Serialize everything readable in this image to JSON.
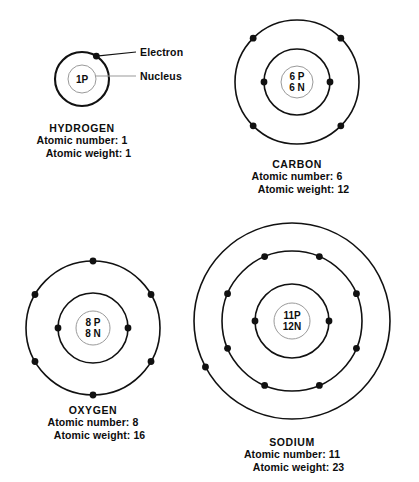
{
  "figure": {
    "background_color": "#ffffff",
    "orbit_color": "#111111",
    "nucleus_stroke_color": "#9a9a9a",
    "electron_color": "#111111",
    "text_color": "#0d0d0d"
  },
  "callouts": {
    "electron": "Electron",
    "nucleus": "Nucleus"
  },
  "labels": {
    "atomic_number_prefix": "Atomic number:",
    "atomic_weight_prefix": "Atomic weight:"
  },
  "atoms": [
    {
      "id": "hydrogen",
      "name": "HYDROGEN",
      "nucleus_text": [
        "1P"
      ],
      "protons": 1,
      "neutrons": 0,
      "atomic_number": 1,
      "atomic_weight": 1,
      "atomic_number_text": "Atomic number: 1",
      "atomic_weight_text": "Atomic weight: 1",
      "shells": [
        {
          "radius": 27,
          "electron_count": 1,
          "electron_angles": [
            58
          ]
        }
      ],
      "nucleus_radius": 14,
      "center": {
        "x": 82,
        "y": 79
      }
    },
    {
      "id": "carbon",
      "name": "CARBON",
      "nucleus_text": [
        "6 P",
        "6 N"
      ],
      "protons": 6,
      "neutrons": 6,
      "atomic_number": 6,
      "atomic_weight": 12,
      "atomic_number_text": "Atomic number: 6",
      "atomic_weight_text": "Atomic weight: 12",
      "shells": [
        {
          "radius": 33,
          "electron_count": 2,
          "electron_angles": [
            180,
            0
          ]
        },
        {
          "radius": 62,
          "electron_count": 4,
          "electron_angles": [
            135,
            45,
            225,
            315
          ]
        }
      ],
      "nucleus_radius": 16,
      "center": {
        "x": 297,
        "y": 82
      }
    },
    {
      "id": "oxygen",
      "name": "OXYGEN",
      "nucleus_text": [
        "8 P",
        "8 N"
      ],
      "protons": 8,
      "neutrons": 8,
      "atomic_number": 8,
      "atomic_weight": 16,
      "atomic_number_text": "Atomic number: 8",
      "atomic_weight_text": "Atomic weight: 16",
      "shells": [
        {
          "radius": 35,
          "electron_count": 2,
          "electron_angles": [
            180,
            0
          ]
        },
        {
          "radius": 67,
          "electron_count": 6,
          "electron_angles": [
            90,
            150,
            210,
            270,
            330,
            30
          ]
        }
      ],
      "nucleus_radius": 17,
      "center": {
        "x": 93,
        "y": 328
      }
    },
    {
      "id": "sodium",
      "name": "SODIUM",
      "nucleus_text": [
        "11P",
        "12N"
      ],
      "protons": 11,
      "neutrons": 12,
      "atomic_number": 11,
      "atomic_weight": 23,
      "atomic_number_text": "Atomic number: 11",
      "atomic_weight_text": "Atomic weight: 23",
      "shells": [
        {
          "radius": 37,
          "electron_count": 2,
          "electron_angles": [
            180,
            0
          ]
        },
        {
          "radius": 70,
          "electron_count": 8,
          "electron_angles": [
            113,
            67,
            157,
            23,
            203,
            337,
            247,
            293
          ]
        },
        {
          "radius": 98,
          "electron_count": 1,
          "electron_angles": [
            208
          ]
        }
      ],
      "nucleus_radius": 18,
      "center": {
        "x": 292,
        "y": 321
      }
    }
  ]
}
